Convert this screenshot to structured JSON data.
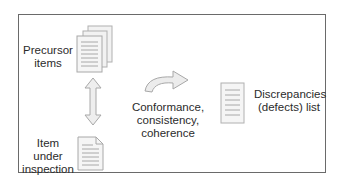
{
  "diagram": {
    "precursor": {
      "label_line1": "Precursor",
      "label_line2": "items",
      "icon": "stacked-documents-icon"
    },
    "item": {
      "label_line1": "Item",
      "label_line2": "under",
      "label_line3": "inspection",
      "icon": "document-icon"
    },
    "process": {
      "label_line1": "Conformance,",
      "label_line2": "consistency,",
      "label_line3": "coherence",
      "icon": "curved-arrow-icon"
    },
    "output": {
      "label_line1": "Discrepancies",
      "label_line2": "(defects) list",
      "icon": "list-document-icon"
    },
    "connector": {
      "icon": "double-headed-arrow-icon"
    },
    "colors": {
      "border": "#6a6a6a",
      "icon_fill": "#ececec",
      "icon_stroke": "#b0b0b0",
      "text": "#2b2b2b"
    }
  }
}
